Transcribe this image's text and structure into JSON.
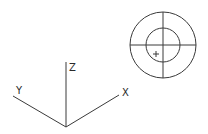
{
  "diagram": {
    "type": "ucs-tripod-and-compass",
    "axis_tripod": {
      "origin": [
        66,
        127
      ],
      "axes": [
        {
          "label": "Z",
          "end": [
            66,
            62
          ],
          "label_pos": [
            69,
            71
          ]
        },
        {
          "label": "Y",
          "end": [
            13,
            96
          ],
          "label_pos": [
            16,
            94
          ]
        },
        {
          "label": "X",
          "end": [
            119,
            95
          ],
          "label_pos": [
            122,
            96
          ]
        }
      ]
    },
    "compass": {
      "center": [
        163,
        45
      ],
      "outer_radius": 33,
      "inner_radius": 17,
      "marker": {
        "symbol": "+",
        "pos": [
          156,
          54
        ]
      }
    },
    "colors": {
      "stroke": "#3a3a3a",
      "text": "#2a2a2a",
      "background": "#ffffff"
    }
  }
}
